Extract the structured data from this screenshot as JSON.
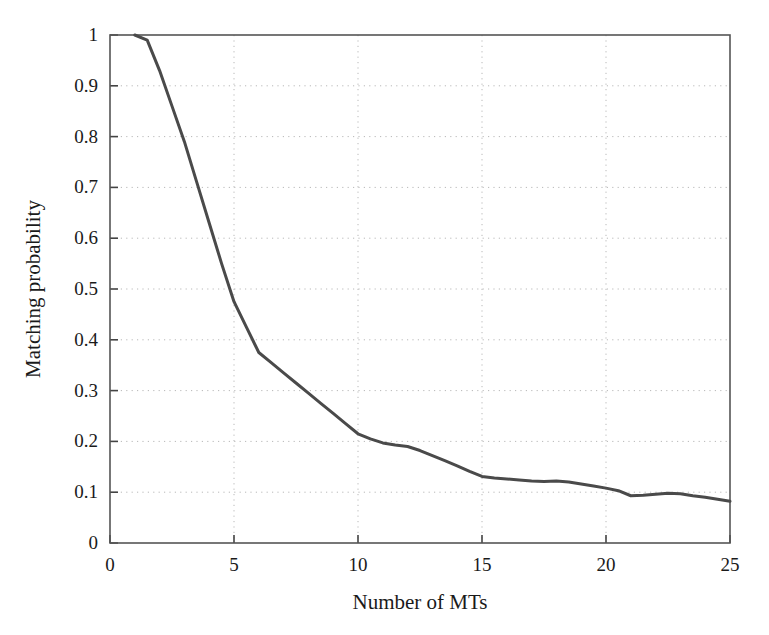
{
  "chart_data": {
    "type": "line",
    "title": "",
    "subtitle": "",
    "xlabel": "Number of MTs",
    "ylabel": "Matching probability",
    "xlim": [
      0,
      25
    ],
    "ylim": [
      0,
      1
    ],
    "xticks": [
      0,
      5,
      10,
      15,
      20,
      25
    ],
    "xtick_labels": [
      "0",
      "5",
      "10",
      "15",
      "20",
      "25"
    ],
    "yticks": [
      0,
      0.1,
      0.2,
      0.3,
      0.4,
      0.5,
      0.6,
      0.7,
      0.8,
      0.9,
      1
    ],
    "ytick_labels": [
      "0",
      "0.1",
      "0.2",
      "0.3",
      "0.4",
      "0.5",
      "0.6",
      "0.7",
      "0.8",
      "0.9",
      "1"
    ],
    "grid": true,
    "grid_style": "dotted",
    "grid_color": "#b8b8b8",
    "legend": null,
    "annotations": [],
    "line_color": "#4a4a4a",
    "line_width": 3,
    "series": [
      {
        "name": "Matching probability",
        "x": [
          1,
          1.5,
          2,
          2.5,
          3,
          3.5,
          4,
          4.5,
          5,
          5.5,
          6,
          6.5,
          7,
          7.5,
          8,
          8.5,
          9,
          9.5,
          10,
          10.5,
          11,
          11.5,
          12,
          12.5,
          13,
          13.5,
          14,
          14.5,
          15,
          15.5,
          16,
          16.5,
          17,
          17.5,
          18,
          18.5,
          19,
          19.5,
          20,
          20.5,
          21,
          21.5,
          22,
          22.5,
          23,
          23.5,
          24,
          24.5,
          25
        ],
        "values": [
          1.0,
          0.99,
          0.93,
          0.86,
          0.79,
          0.71,
          0.63,
          0.55,
          0.475,
          0.425,
          0.375,
          0.355,
          0.335,
          0.315,
          0.295,
          0.275,
          0.255,
          0.235,
          0.215,
          0.205,
          0.197,
          0.193,
          0.19,
          0.182,
          0.172,
          0.162,
          0.152,
          0.141,
          0.131,
          0.128,
          0.126,
          0.124,
          0.122,
          0.121,
          0.122,
          0.12,
          0.116,
          0.112,
          0.108,
          0.103,
          0.093,
          0.094,
          0.096,
          0.098,
          0.097,
          0.093,
          0.09,
          0.086,
          0.082
        ]
      }
    ]
  },
  "axes": {
    "x_axis_name": "x-axis",
    "y_axis_name": "y-axis"
  }
}
